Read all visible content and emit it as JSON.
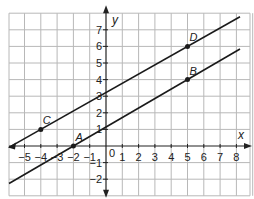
{
  "chart_data": {
    "type": "line",
    "title": "",
    "xlabel": "x",
    "ylabel": "y",
    "xlim": [
      -6,
      9
    ],
    "ylim": [
      -3,
      8
    ],
    "grid": true,
    "x_ticks": [
      "-5",
      "-4",
      "-3",
      "-2",
      "-1",
      "0",
      "1",
      "2",
      "3",
      "4",
      "5",
      "6",
      "7",
      "8"
    ],
    "y_ticks": [
      "-2",
      "-1",
      "1",
      "2",
      "3",
      "4",
      "5",
      "6",
      "7"
    ],
    "points": [
      {
        "label": "A",
        "x": -2,
        "y": 0
      },
      {
        "label": "B",
        "x": 5,
        "y": 4
      },
      {
        "label": "C",
        "x": -4,
        "y": 1
      },
      {
        "label": "D",
        "x": 5,
        "y": 6
      }
    ],
    "series": [
      {
        "name": "line CD",
        "through": [
          "C",
          "D"
        ],
        "slope": 0.5556
      },
      {
        "name": "line AB",
        "through": [
          "A",
          "B"
        ],
        "slope": 0.5714
      }
    ]
  },
  "labels": {
    "x_axis": "x",
    "y_axis": "y",
    "origin": "0"
  },
  "colors": {
    "grid": "#b8b8b8",
    "axis": "#222222",
    "line": "#1a1a1a"
  }
}
